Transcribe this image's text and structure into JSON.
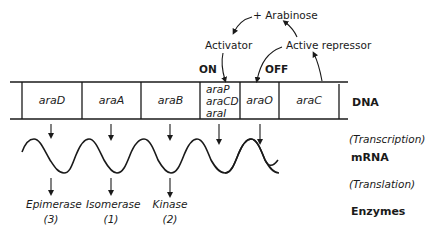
{
  "diagram": {
    "title": "",
    "regulation": {
      "inducer": "+ Arabinose",
      "activator": "Activator",
      "active_repressor": "Active repressor",
      "on_label": "ON",
      "off_label": "OFF"
    },
    "dna": {
      "label": "DNA",
      "genes": [
        {
          "id": "araD",
          "label": "araD"
        },
        {
          "id": "araA",
          "label": "araA"
        },
        {
          "id": "araB",
          "label": "araB"
        },
        {
          "id": "regulatory",
          "lines": [
            "araP",
            "araCD",
            "araI"
          ]
        },
        {
          "id": "araO",
          "label": "araO"
        },
        {
          "id": "araC",
          "label": "araC"
        }
      ]
    },
    "process_labels": {
      "transcription": "(Transcription)",
      "mrna": "mRNA",
      "translation": "(Translation)",
      "enzymes": "Enzymes"
    },
    "enzymes": [
      {
        "name": "Epimerase",
        "number": "(3)"
      },
      {
        "name": "Isomerase",
        "number": "(1)"
      },
      {
        "name": "Kinase",
        "number": "(2)"
      }
    ]
  }
}
